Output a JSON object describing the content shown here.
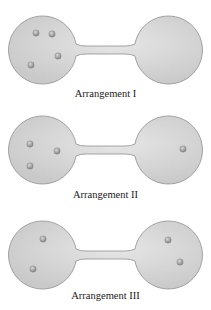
{
  "colors": {
    "bulb_fill": "#c9c9c9",
    "bulb_highlight": "#e6e6e6",
    "bulb_stroke": "#8f8f8f",
    "particle": "#8a8a8a",
    "particle_highlight": "#d8d8d8"
  },
  "arrangements": [
    {
      "label": "Arrangement I",
      "left_count": 4,
      "right_count": 0,
      "left_particles": [
        [
          36,
          33
        ],
        [
          52,
          34
        ],
        [
          58,
          56
        ],
        [
          31,
          65
        ]
      ],
      "right_particles": []
    },
    {
      "label": "Arrangement II",
      "left_count": 3,
      "right_count": 1,
      "left_particles": [
        [
          30,
          44
        ],
        [
          57,
          51
        ],
        [
          30,
          66
        ]
      ],
      "right_particles": [
        [
          183,
          49
        ]
      ]
    },
    {
      "label": "Arrangement III",
      "left_count": 2,
      "right_count": 2,
      "left_particles": [
        [
          43,
          34
        ],
        [
          33,
          64
        ]
      ],
      "right_particles": [
        [
          168,
          35
        ],
        [
          180,
          57
        ]
      ]
    }
  ]
}
